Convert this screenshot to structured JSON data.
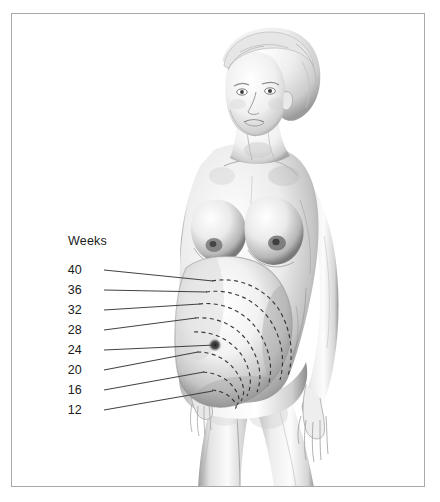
{
  "figure": {
    "medium": "graphite-pencil-illustration",
    "background_color": "#ffffff",
    "border_color": "#a9a9a9",
    "label_color": "#1b1b1b",
    "arc_color": "#2c2c2c",
    "leader_color": "#3a3a3a",
    "skin_light": "#fdfdfd",
    "skin_mid": "#c9c9c9",
    "skin_shadow": "#6e6e6e",
    "hair_color": "#d8d8d8"
  },
  "legend": {
    "heading": "Weeks"
  },
  "fundal_heights": [
    {
      "weeks": "40",
      "label_x": 82,
      "label_y": 264,
      "leader_x1": 104,
      "leader_y1": 270,
      "leader_x2": 214,
      "leader_y2": 281
    },
    {
      "weeks": "36",
      "label_x": 82,
      "label_y": 284,
      "leader_x1": 104,
      "leader_y1": 290,
      "leader_x2": 208,
      "leader_y2": 292
    },
    {
      "weeks": "32",
      "label_x": 82,
      "label_y": 304,
      "leader_x1": 104,
      "leader_y1": 310,
      "leader_x2": 200,
      "leader_y2": 304
    },
    {
      "weeks": "28",
      "label_x": 82,
      "label_y": 324,
      "leader_x1": 104,
      "leader_y1": 330,
      "leader_x2": 196,
      "leader_y2": 318
    },
    {
      "weeks": "24",
      "label_x": 82,
      "label_y": 344,
      "leader_x1": 104,
      "leader_y1": 350,
      "leader_x2": 216,
      "leader_y2": 345
    },
    {
      "weeks": "20",
      "label_x": 82,
      "label_y": 364,
      "leader_x1": 104,
      "leader_y1": 370,
      "leader_x2": 198,
      "leader_y2": 352
    },
    {
      "weeks": "16",
      "label_x": 82,
      "label_y": 384,
      "leader_x1": 104,
      "leader_y1": 390,
      "leader_x2": 204,
      "leader_y2": 372
    },
    {
      "weeks": "12",
      "label_x": 82,
      "label_y": 404,
      "leader_x1": 104,
      "leader_y1": 410,
      "leader_x2": 214,
      "leader_y2": 392
    }
  ],
  "anatomy": {
    "navel": {
      "x": 215,
      "y": 345,
      "name": "umbilicus"
    },
    "head_center": {
      "x": 258,
      "y": 90
    },
    "abdomen_center": {
      "x": 232,
      "y": 330
    }
  }
}
